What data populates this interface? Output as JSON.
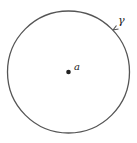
{
  "diagram": {
    "curve_label": "γ",
    "point_label": "a",
    "stroke_color": "#555555",
    "point_color": "#222222"
  }
}
